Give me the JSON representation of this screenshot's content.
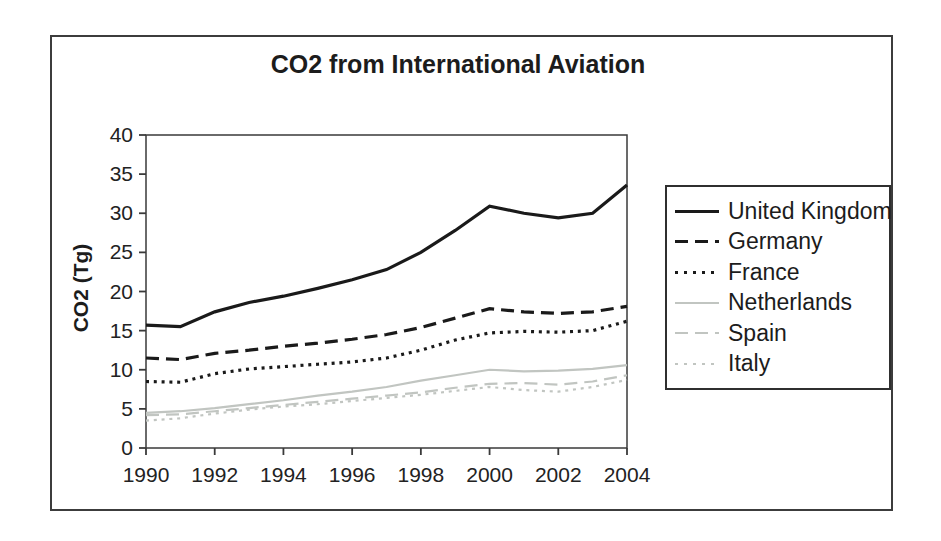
{
  "figure": {
    "background_color": "#ffffff",
    "frame_border_color": "#3c3c3c"
  },
  "chart_data": {
    "type": "line",
    "title": "CO2 from International Aviation",
    "xlabel": "",
    "ylabel": "CO2 (Tg)",
    "x": [
      1990,
      1991,
      1992,
      1993,
      1994,
      1995,
      1996,
      1997,
      1998,
      1999,
      2000,
      2001,
      2002,
      2003,
      2004
    ],
    "xticks": [
      "1990",
      "1992",
      "1994",
      "1996",
      "1998",
      "2000",
      "2002",
      "2004"
    ],
    "yticks": [
      "0",
      "5",
      "10",
      "15",
      "20",
      "25",
      "30",
      "35",
      "40"
    ],
    "ylim": [
      0,
      40
    ],
    "xlim": [
      1990,
      2004
    ],
    "grid": false,
    "legend_position": "right",
    "axis_color": "#3a3a3a",
    "series": [
      {
        "name": "United Kingdom",
        "color": "#1a1a1a",
        "style": "solid",
        "width": 3.2,
        "values": [
          15.7,
          15.5,
          17.4,
          18.6,
          19.4,
          20.4,
          21.5,
          22.8,
          25.0,
          27.8,
          30.9,
          30.0,
          29.4,
          30.0,
          33.6
        ]
      },
      {
        "name": "Germany",
        "color": "#1a1a1a",
        "style": "dashed",
        "width": 3.2,
        "values": [
          11.5,
          11.3,
          12.1,
          12.5,
          13.0,
          13.4,
          13.9,
          14.5,
          15.4,
          16.6,
          17.8,
          17.4,
          17.2,
          17.4,
          18.1
        ]
      },
      {
        "name": "France",
        "color": "#1a1a1a",
        "style": "dotted",
        "width": 3.2,
        "values": [
          8.5,
          8.4,
          9.5,
          10.1,
          10.4,
          10.7,
          11.0,
          11.5,
          12.5,
          13.8,
          14.7,
          14.9,
          14.8,
          15.0,
          16.2
        ]
      },
      {
        "name": "Netherlands",
        "color": "#c1c5c1",
        "style": "solid",
        "width": 2.2,
        "values": [
          4.5,
          4.7,
          5.1,
          5.6,
          6.1,
          6.7,
          7.2,
          7.8,
          8.6,
          9.3,
          10.0,
          9.8,
          9.9,
          10.1,
          10.6
        ]
      },
      {
        "name": "Spain",
        "color": "#c1c5c1",
        "style": "dashed",
        "width": 2.2,
        "values": [
          4.2,
          4.3,
          4.7,
          5.1,
          5.5,
          5.9,
          6.3,
          6.7,
          7.1,
          7.7,
          8.2,
          8.3,
          8.1,
          8.5,
          9.3
        ]
      },
      {
        "name": "Italy",
        "color": "#c1c5c1",
        "style": "dotted",
        "width": 2.2,
        "values": [
          3.5,
          3.8,
          4.4,
          4.9,
          5.3,
          5.6,
          6.0,
          6.4,
          6.8,
          7.3,
          7.8,
          7.4,
          7.2,
          7.8,
          8.7
        ]
      }
    ]
  }
}
